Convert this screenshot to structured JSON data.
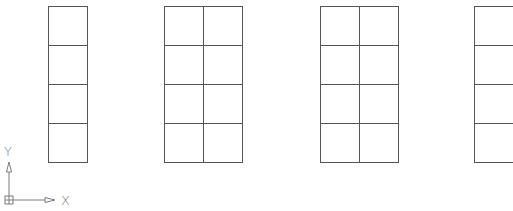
{
  "drawing": {
    "line_color": "#555555",
    "grids": [
      {
        "id": "grid-1",
        "x": 48,
        "y": 6,
        "cols": 1,
        "rows": 4,
        "cell_w": 39,
        "cell_h": 39
      },
      {
        "id": "grid-2",
        "x": 164,
        "y": 6,
        "cols": 2,
        "rows": 4,
        "cell_w": 39,
        "cell_h": 39
      },
      {
        "id": "grid-3",
        "x": 320,
        "y": 6,
        "cols": 2,
        "rows": 4,
        "cell_w": 39,
        "cell_h": 39
      },
      {
        "id": "grid-4",
        "x": 474,
        "y": 6,
        "cols": 1,
        "rows": 4,
        "cell_w": 39,
        "cell_h": 39
      }
    ]
  },
  "ucs_icon": {
    "y_label": "Y",
    "x_label": "X",
    "color": "#7a7a7a"
  }
}
